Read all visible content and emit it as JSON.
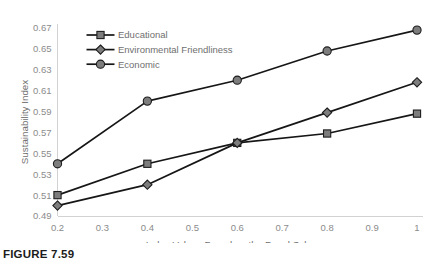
{
  "figure": {
    "caption": "FIGURE 7.59"
  },
  "chart_data": {
    "type": "line",
    "title": "",
    "xlabel": "Index Values Based on the Panel Scheme",
    "ylabel": "Sustainability Index",
    "x": [
      0.2,
      0.4,
      0.6,
      0.8,
      1.0
    ],
    "xlim": [
      0.2,
      1.0
    ],
    "ylim": [
      0.49,
      0.67
    ],
    "xticks": [
      "0.2",
      "0.3",
      "0.4",
      "0.5",
      "0.6",
      "0.7",
      "0.8",
      "0.9",
      "1"
    ],
    "xtick_values": [
      0.2,
      0.3,
      0.4,
      0.5,
      0.6,
      0.7,
      0.8,
      0.9,
      1.0
    ],
    "yticks": [
      "0.49",
      "0.51",
      "0.53",
      "0.55",
      "0.57",
      "0.59",
      "0.61",
      "0.63",
      "0.65",
      "0.67"
    ],
    "ytick_values": [
      0.49,
      0.51,
      0.53,
      0.55,
      0.57,
      0.59,
      0.61,
      0.63,
      0.65,
      0.67
    ],
    "grid": false,
    "legend_position": "top-left-inside",
    "series": [
      {
        "name": "Educational",
        "marker": "square",
        "values": [
          0.51,
          0.54,
          0.56,
          0.569,
          0.588
        ]
      },
      {
        "name": "Environmental Friendliness",
        "marker": "diamond",
        "values": [
          0.5,
          0.52,
          0.56,
          0.589,
          0.618
        ]
      },
      {
        "name": "Economic",
        "marker": "circle",
        "values": [
          0.54,
          0.6,
          0.62,
          0.648,
          0.668
        ]
      }
    ],
    "colors": {
      "line": "#161616",
      "marker_fill": "#7d7d7d",
      "marker_stroke": "#1d1d1d",
      "axis": "#d2d2d2",
      "text": "#6f6f6f",
      "background": "#ffffff"
    }
  }
}
